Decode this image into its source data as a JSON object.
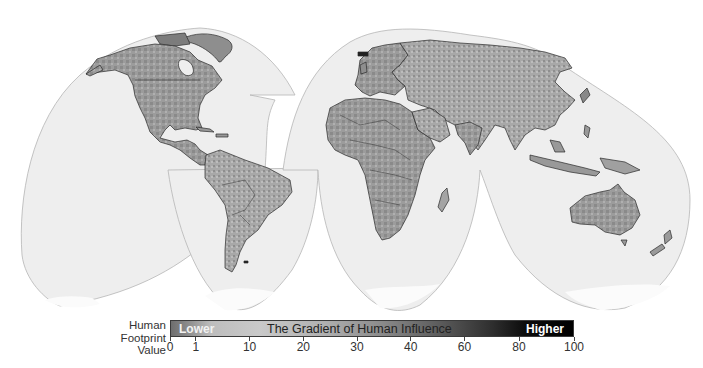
{
  "map": {
    "projection": "Interrupted Goode Homolosine",
    "ocean_color": "#eeeeee",
    "outline_color": "#b5b5b5",
    "land_base_color": "#9a9a9a",
    "border_color": "#2a2a2a",
    "ice_color": "#fafafa",
    "regions": [
      "North America",
      "Greenland",
      "South America",
      "Europe",
      "Africa",
      "Asia",
      "Australia",
      "New Zealand",
      "Antarctica"
    ]
  },
  "legend": {
    "label_line1": "Human",
    "label_line2": "Footprint",
    "label_line3": "Value",
    "bar_lower": "Lower",
    "bar_title": "The Gradient of Human Influence",
    "bar_higher": "Higher",
    "color_low": "#6e6e6e",
    "color_mid": "#c9c9c9",
    "color_high": "#000000",
    "ticks": [
      {
        "value": "0",
        "pos": 0
      },
      {
        "value": "1",
        "pos": 6.4
      },
      {
        "value": "10",
        "pos": 19.7
      },
      {
        "value": "20",
        "pos": 33.0
      },
      {
        "value": "30",
        "pos": 46.3
      },
      {
        "value": "40",
        "pos": 59.6
      },
      {
        "value": "60",
        "pos": 72.9
      },
      {
        "value": "80",
        "pos": 86.4
      },
      {
        "value": "100",
        "pos": 100
      }
    ]
  }
}
